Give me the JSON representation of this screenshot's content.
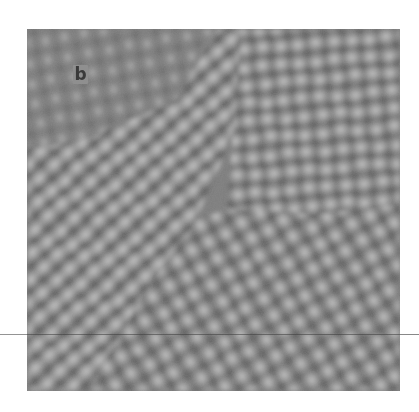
{
  "figure": {
    "panel_label": "b",
    "colors": {
      "page_background": "#ffffff",
      "panel_mid_gray": "#7d7d7d",
      "lattice_dark": "#555555",
      "lattice_bright": "#cdcdcd",
      "label_box": "#8f8f8f",
      "label_text": "#3a3a3a"
    },
    "panel_box": {
      "x": 27,
      "y": 29,
      "width": 373,
      "height": 362
    },
    "artifact": {
      "type": "horizontal-scan-line",
      "y": 334
    },
    "grains": [
      {
        "name": "upper-left",
        "orientation_deg": 80,
        "spacing_px": 20,
        "contrast": "low"
      },
      {
        "name": "left-diagonal",
        "orientation_deg": -40,
        "spacing_px": 18,
        "contrast": "high"
      },
      {
        "name": "upper-right",
        "orientation_deg": -5,
        "spacing_px": 18,
        "contrast": "high"
      },
      {
        "name": "lower-right",
        "orientation_deg": 60,
        "spacing_px": 19,
        "contrast": "high"
      }
    ]
  }
}
